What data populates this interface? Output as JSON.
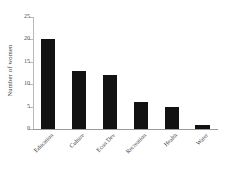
{
  "chart_data": {
    "type": "bar",
    "title": "",
    "xlabel": "",
    "ylabel": "Number of women",
    "categories": [
      "Education",
      "Culture",
      "Econ Dev",
      "Recreation",
      "Health",
      "Water"
    ],
    "values": [
      20,
      13,
      12,
      6,
      5,
      1
    ],
    "ylim": [
      0,
      25
    ],
    "yticks": [
      0,
      5,
      10,
      15,
      20,
      25
    ],
    "ytick_labels": [
      "0",
      "5",
      "10",
      "15",
      "20",
      "25"
    ],
    "grid": false,
    "legend": null,
    "bar_color": "#121212",
    "axis_color": "#b9b9b9",
    "background": "#ffffff",
    "xtick_rotation": -45
  }
}
